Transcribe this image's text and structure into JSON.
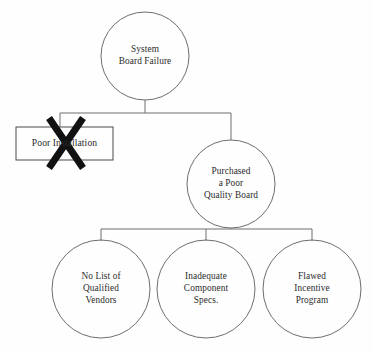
{
  "diagram": {
    "type": "fault-tree",
    "background_color": "#fefefe",
    "stroke_color": "#6e6e6e",
    "text_color": "#2b2b2b",
    "mark_color": "#111111",
    "nodes": {
      "root": {
        "label": "System\nBoard Failure",
        "shape": "circle",
        "cx": 145,
        "cy": 56,
        "r": 44
      },
      "poor_installation": {
        "label": "Poor Installation",
        "shape": "rectangle",
        "x": 16,
        "y": 127,
        "width": 97,
        "height": 33,
        "struck_out": true,
        "mark": "X"
      },
      "purchased_poor_quality": {
        "label": "Purchased\na Poor\nQuality Board",
        "shape": "circle",
        "cx": 231,
        "cy": 184,
        "r": 44
      },
      "no_list_vendors": {
        "label": "No List of\nQualified\nVendors",
        "shape": "circle",
        "cx": 101,
        "cy": 289,
        "r": 49
      },
      "inadequate_specs": {
        "label": "Inadequate\nComponent\nSpecs.",
        "shape": "circle",
        "cx": 206,
        "cy": 289,
        "r": 49
      },
      "flawed_incentive": {
        "label": "Flawed\nIncentive\nProgram",
        "shape": "circle",
        "cx": 312,
        "cy": 289,
        "r": 49
      }
    },
    "connectors": [
      {
        "name": "root-stem",
        "from": "root",
        "to": "tier1-bus"
      },
      {
        "name": "tier1-bus",
        "orientation": "horizontal"
      },
      {
        "name": "tier1-left-drop",
        "to": "poor_installation"
      },
      {
        "name": "tier1-right-drop",
        "to": "purchased_poor_quality"
      },
      {
        "name": "purchased-stem",
        "from": "purchased_poor_quality",
        "to": "tier2-bus"
      },
      {
        "name": "tier2-bus",
        "orientation": "horizontal"
      },
      {
        "name": "tier2-left-drop",
        "to": "no_list_vendors"
      },
      {
        "name": "tier2-mid-drop",
        "to": "inadequate_specs"
      },
      {
        "name": "tier2-right-drop",
        "to": "flawed_incentive"
      }
    ]
  }
}
